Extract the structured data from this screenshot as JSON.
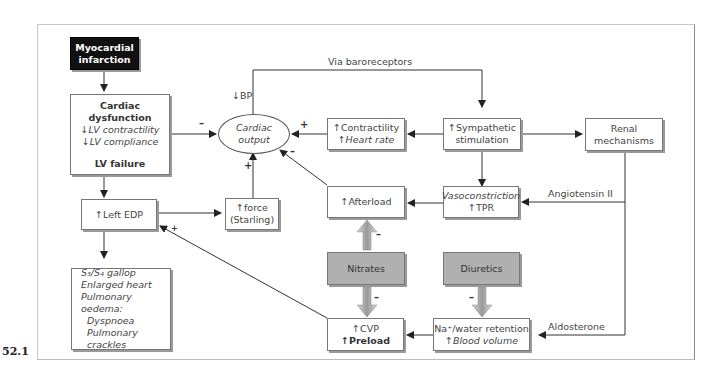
{
  "figure_number": "52.1",
  "nodes": {
    "mi": {
      "l1": "Myocardial",
      "l2": "infarction"
    },
    "cardiac_dysfunction": {
      "title": "Cardiac dysfunction",
      "l1": "↓LV contractility",
      "l2": "↓LV compliance",
      "footer": "LV failure"
    },
    "cardiac_output": {
      "l1": "Cardiac",
      "l2": "output"
    },
    "contractility_hr": {
      "l1": "↑Contractility",
      "l2": "↑Heart rate"
    },
    "sympathetic": {
      "l1": "↑Sympathetic",
      "l2": "stimulation"
    },
    "renal": {
      "l1": "Renal",
      "l2": "mechanisms"
    },
    "left_edp": {
      "l1": "↑Left EDP"
    },
    "force": {
      "l1": "↑force",
      "l2": "(Starling)"
    },
    "afterload": {
      "l1": "↑Afterload"
    },
    "vasoconstriction": {
      "l1": "Vasoconstriction",
      "l2": "↑TPR"
    },
    "nitrates": {
      "l1": "Nitrates"
    },
    "diuretics": {
      "l1": "Diuretics"
    },
    "symptoms": {
      "l1": "S₃/S₄ gallop",
      "l2": "Enlarged heart",
      "l3": "Pulmonary oedema:",
      "l4": "Dyspnoea",
      "l5": "Pulmonary crackles"
    },
    "cvp_preload": {
      "l1": "↑CVP",
      "l2": "↑Preload"
    },
    "na_water": {
      "l1": "Na⁺/water retention",
      "l2": "↑Blood volume"
    }
  },
  "labels": {
    "baroreceptors": "Via baroreceptors",
    "bp": "↓BP",
    "angiotensin": "Angiotensin II",
    "aldosterone": "Aldosterone"
  },
  "signs": {
    "dysfunction_to_co": "–",
    "contractility_to_co": "+",
    "afterload_to_co": "–",
    "force_to_co": "+",
    "nitrates_to_afterload": "–",
    "nitrates_to_preload": "–",
    "diuretics_to_na": "–",
    "preload_to_edp": "+"
  },
  "colors": {
    "line": "#333333",
    "dark_box": "#111111",
    "drug_box": "#b0b0b0"
  }
}
